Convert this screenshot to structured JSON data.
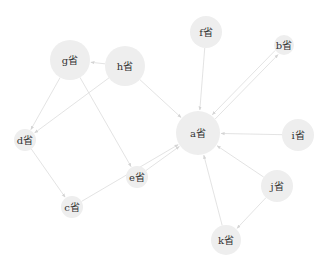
{
  "diagram": {
    "type": "directed-graph",
    "node_color": "#eeeeee",
    "edge_color": "#dcdcdc",
    "label_color": "#333333",
    "nodes": [
      {
        "id": "a",
        "label": "a省",
        "x": 198,
        "y": 133,
        "r": 22
      },
      {
        "id": "b",
        "label": "b省",
        "x": 284,
        "y": 45,
        "r": 10
      },
      {
        "id": "c",
        "label": "c省",
        "x": 72,
        "y": 207,
        "r": 11
      },
      {
        "id": "d",
        "label": "d省",
        "x": 25,
        "y": 140,
        "r": 11
      },
      {
        "id": "e",
        "label": "e省",
        "x": 137,
        "y": 177,
        "r": 11
      },
      {
        "id": "f",
        "label": "f省",
        "x": 206,
        "y": 32,
        "r": 16
      },
      {
        "id": "g",
        "label": "g省",
        "x": 70,
        "y": 60,
        "r": 20
      },
      {
        "id": "h",
        "label": "h省",
        "x": 125,
        "y": 66,
        "r": 20
      },
      {
        "id": "i",
        "label": "i省",
        "x": 298,
        "y": 135,
        "r": 16
      },
      {
        "id": "j",
        "label": "j省",
        "x": 277,
        "y": 186,
        "r": 16
      },
      {
        "id": "k",
        "label": "k省",
        "x": 226,
        "y": 240,
        "r": 15
      }
    ],
    "edges": [
      {
        "from": "h",
        "to": "g"
      },
      {
        "from": "h",
        "to": "d"
      },
      {
        "from": "h",
        "to": "a"
      },
      {
        "from": "g",
        "to": "d"
      },
      {
        "from": "g",
        "to": "e"
      },
      {
        "from": "d",
        "to": "c"
      },
      {
        "from": "c",
        "to": "a"
      },
      {
        "from": "e",
        "to": "a"
      },
      {
        "from": "f",
        "to": "a"
      },
      {
        "from": "a",
        "to": "b",
        "offset": 2.5
      },
      {
        "from": "b",
        "to": "a",
        "offset": 2.5
      },
      {
        "from": "i",
        "to": "a"
      },
      {
        "from": "j",
        "to": "a"
      },
      {
        "from": "j",
        "to": "k"
      },
      {
        "from": "k",
        "to": "a"
      }
    ]
  }
}
